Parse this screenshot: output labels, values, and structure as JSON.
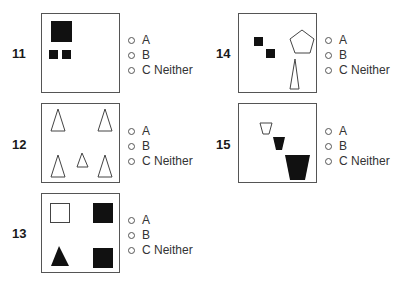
{
  "options": [
    {
      "radio": "○",
      "label": "A"
    },
    {
      "radio": "○",
      "label": "B"
    },
    {
      "radio": "○",
      "label": "C Neither"
    }
  ],
  "questions": [
    {
      "number": "11",
      "figure": "one large black square above two small black squares"
    },
    {
      "number": "12",
      "figure": "five outline triangles: four large at corners, one small in center"
    },
    {
      "number": "13",
      "figure": "outline square, black square, black triangle, black square"
    },
    {
      "number": "14",
      "figure": "two small black squares, outline pentagon, tall thin outline triangle"
    },
    {
      "number": "15",
      "figure": "three trapezoids increasing in size: outline, black, black"
    }
  ],
  "colors": {
    "border": "#555555",
    "fill": "#111111",
    "text": "#222222"
  }
}
